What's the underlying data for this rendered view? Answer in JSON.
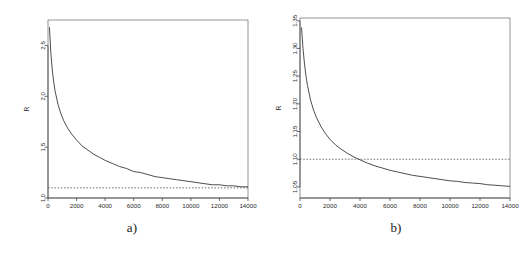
{
  "figure": {
    "background": "#ffffff",
    "panel_count": 2
  },
  "chart_data": [
    {
      "type": "line",
      "panel": "a",
      "caption": "a)",
      "title": "",
      "xlabel": "",
      "ylabel": "R",
      "xlim": [
        0,
        14000
      ],
      "ylim": [
        1.0,
        2.75
      ],
      "grid": false,
      "legend": "none",
      "xticks": [
        0,
        2000,
        4000,
        6000,
        8000,
        10000,
        12000,
        14000
      ],
      "xticklabels": [
        "0",
        "2000",
        "4000",
        "6000",
        "8000",
        "10000",
        "12000",
        "14000"
      ],
      "yticks": [
        1.0,
        1.5,
        2.0,
        2.5
      ],
      "yticklabels": [
        "1.0",
        "1.5",
        "2.0",
        "2.5"
      ],
      "series": [
        {
          "name": "R",
          "style": "solid",
          "color": "#3a3a3a",
          "x": [
            100,
            200,
            300,
            400,
            500,
            700,
            900,
            1100,
            1400,
            1700,
            2000,
            2400,
            2800,
            3200,
            3600,
            4000,
            4500,
            5000,
            5500,
            6000,
            6500,
            7000,
            7500,
            8000,
            8500,
            9000,
            9500,
            10000,
            10500,
            11000,
            11500,
            12000,
            12500,
            13000,
            13500,
            14000
          ],
          "y": [
            2.68,
            2.42,
            2.26,
            2.14,
            2.05,
            1.92,
            1.83,
            1.76,
            1.68,
            1.62,
            1.57,
            1.51,
            1.47,
            1.43,
            1.4,
            1.37,
            1.34,
            1.31,
            1.29,
            1.26,
            1.25,
            1.23,
            1.21,
            1.2,
            1.19,
            1.18,
            1.17,
            1.16,
            1.15,
            1.14,
            1.13,
            1.13,
            1.12,
            1.12,
            1.11,
            1.11
          ]
        },
        {
          "name": "reference-line",
          "style": "dashed",
          "color": "#555555",
          "y_constant": 1.1
        }
      ]
    },
    {
      "type": "line",
      "panel": "b",
      "caption": "b)",
      "title": "",
      "xlabel": "",
      "ylabel": "R",
      "xlim": [
        0,
        14000
      ],
      "ylim": [
        1.03,
        1.355
      ],
      "grid": false,
      "legend": "none",
      "xticks": [
        0,
        2000,
        4000,
        6000,
        8000,
        10000,
        12000,
        14000
      ],
      "xticklabels": [
        "0",
        "2000",
        "4000",
        "6000",
        "8000",
        "10000",
        "12000",
        "14000"
      ],
      "yticks": [
        1.05,
        1.1,
        1.15,
        1.2,
        1.25,
        1.3,
        1.35
      ],
      "yticklabels": [
        "1.05",
        "1.10",
        "1.15",
        "1.20",
        "1.25",
        "1.30",
        "1.35"
      ],
      "series": [
        {
          "name": "R",
          "style": "solid",
          "color": "#3a3a3a",
          "x": [
            100,
            200,
            300,
            400,
            500,
            700,
            900,
            1100,
            1400,
            1700,
            2000,
            2400,
            2800,
            3200,
            3600,
            4000,
            4500,
            5000,
            5500,
            6000,
            6500,
            7000,
            7500,
            8000,
            8500,
            9000,
            9500,
            10000,
            10500,
            11000,
            11500,
            12000,
            12500,
            13000,
            13500,
            14000
          ],
          "y": [
            1.338,
            1.3,
            1.272,
            1.25,
            1.233,
            1.207,
            1.189,
            1.175,
            1.159,
            1.146,
            1.136,
            1.125,
            1.117,
            1.11,
            1.104,
            1.099,
            1.093,
            1.088,
            1.084,
            1.08,
            1.077,
            1.074,
            1.071,
            1.069,
            1.067,
            1.065,
            1.063,
            1.061,
            1.06,
            1.058,
            1.057,
            1.056,
            1.054,
            1.053,
            1.052,
            1.051
          ]
        },
        {
          "name": "reference-line",
          "style": "dashed",
          "color": "#555555",
          "y_constant": 1.1
        }
      ]
    }
  ]
}
